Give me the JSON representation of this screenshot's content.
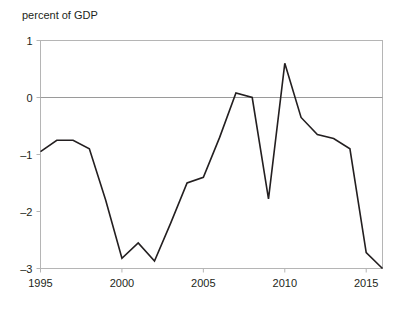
{
  "chart_data": {
    "type": "line",
    "title": "",
    "ylabel": "percent of GDP",
    "xlabel": "",
    "grid": false,
    "legend": "none",
    "zero_line": true,
    "xlim": [
      1995,
      2016
    ],
    "ylim": [
      -3.2,
      1.2
    ],
    "yticks": [
      1,
      0,
      -1,
      -2,
      -3
    ],
    "ytick_labels": [
      "1",
      "0",
      "–1",
      "–2",
      "–3"
    ],
    "xticks": [
      1995,
      2000,
      2005,
      2010,
      2015
    ],
    "xtick_labels": [
      "1995",
      "2000",
      "2005",
      "2010",
      "2015"
    ],
    "line_color": "#231f20",
    "zero_line_color": "#9a9a9a",
    "axis_color": "#b5b5b5",
    "x": [
      1995,
      1996,
      1997,
      1998,
      1999,
      2000,
      2001,
      2002,
      2003,
      2004,
      2005,
      2006,
      2007,
      2008,
      2009,
      2010,
      2011,
      2012,
      2013,
      2014,
      2015,
      2016
    ],
    "values": [
      -0.95,
      -0.75,
      -0.75,
      -0.9,
      -1.8,
      -2.82,
      -2.55,
      -2.87,
      -2.2,
      -1.5,
      -1.4,
      -0.7,
      0.08,
      0.0,
      -1.78,
      0.6,
      -0.35,
      -0.65,
      -0.72,
      -0.9,
      -2.72,
      -3.0
    ],
    "series": [
      {
        "name": "percent of GDP",
        "values": [
          -0.95,
          -0.75,
          -0.75,
          -0.9,
          -1.8,
          -2.82,
          -2.55,
          -2.87,
          -2.2,
          -1.5,
          -1.4,
          -0.7,
          0.08,
          0.0,
          -1.78,
          0.6,
          -0.35,
          -0.65,
          -0.72,
          -0.9,
          -2.72,
          -3.0
        ]
      }
    ]
  }
}
